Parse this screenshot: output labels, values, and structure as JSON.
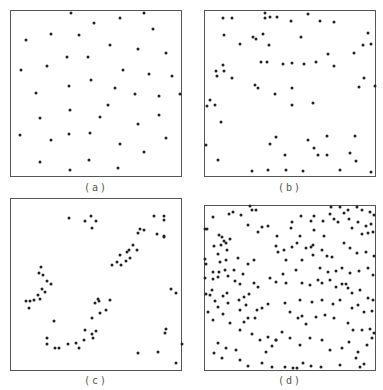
{
  "chart_data": [
    {
      "type": "scatter",
      "label": "(a)",
      "frame": {
        "x": 10,
        "y": 10,
        "w": 172,
        "h": 167
      },
      "label_pos": {
        "x": 96,
        "y": 183
      },
      "points": [
        [
          71,
          13
        ],
        [
          120,
          18
        ],
        [
          144,
          13
        ],
        [
          94,
          23
        ],
        [
          153,
          29
        ],
        [
          26,
          40
        ],
        [
          51,
          34
        ],
        [
          79,
          35
        ],
        [
          110,
          45
        ],
        [
          138,
          49
        ],
        [
          166,
          53
        ],
        [
          67,
          57
        ],
        [
          88,
          57
        ],
        [
          21,
          70
        ],
        [
          47,
          66
        ],
        [
          123,
          70
        ],
        [
          149,
          74
        ],
        [
          172,
          76
        ],
        [
          91,
          80
        ],
        [
          69,
          86
        ],
        [
          115,
          88
        ],
        [
          36,
          93
        ],
        [
          135,
          94
        ],
        [
          159,
          96
        ],
        [
          180,
          94
        ],
        [
          70,
          110
        ],
        [
          108,
          105
        ],
        [
          40,
          118
        ],
        [
          100,
          117
        ],
        [
          159,
          115
        ],
        [
          138,
          124
        ],
        [
          20,
          135
        ],
        [
          51,
          140
        ],
        [
          69,
          134
        ],
        [
          90,
          133
        ],
        [
          166,
          138
        ],
        [
          120,
          144
        ],
        [
          144,
          152
        ],
        [
          40,
          162
        ],
        [
          89,
          160
        ],
        [
          70,
          170
        ],
        [
          118,
          168
        ]
      ]
    },
    {
      "type": "scatter",
      "label": "(b)",
      "frame": {
        "x": 204,
        "y": 10,
        "w": 172,
        "h": 167
      },
      "label_pos": {
        "x": 290,
        "y": 183
      },
      "points": [
        [
          223,
          18
        ],
        [
          232,
          18
        ],
        [
          265,
          13
        ],
        [
          265,
          18
        ],
        [
          270,
          17
        ],
        [
          277,
          17
        ],
        [
          291,
          21
        ],
        [
          308,
          14
        ],
        [
          320,
          21
        ],
        [
          334,
          22
        ],
        [
          368,
          33
        ],
        [
          363,
          45
        ],
        [
          371,
          44
        ],
        [
          224,
          35
        ],
        [
          253,
          37
        ],
        [
          256,
          39
        ],
        [
          263,
          34
        ],
        [
          240,
          44
        ],
        [
          269,
          45
        ],
        [
          301,
          37
        ],
        [
          328,
          54
        ],
        [
          354,
          53
        ],
        [
          261,
          62
        ],
        [
          267,
          62
        ],
        [
          283,
          64
        ],
        [
          292,
          63
        ],
        [
          304,
          64
        ],
        [
          316,
          62
        ],
        [
          334,
          66
        ],
        [
          223,
          65
        ],
        [
          216,
          71
        ],
        [
          224,
          71
        ],
        [
          217,
          76
        ],
        [
          232,
          78
        ],
        [
          364,
          78
        ],
        [
          359,
          87
        ],
        [
          255,
          85
        ],
        [
          258,
          88
        ],
        [
          292,
          88
        ],
        [
          275,
          94
        ],
        [
          292,
          105
        ],
        [
          313,
          103
        ],
        [
          210,
          100
        ],
        [
          207,
          106
        ],
        [
          215,
          105
        ],
        [
          221,
          122
        ],
        [
          375,
          86
        ],
        [
          355,
          136
        ],
        [
          276,
          137
        ],
        [
          308,
          140
        ],
        [
          327,
          136
        ],
        [
          270,
          144
        ],
        [
          314,
          148
        ],
        [
          318,
          155
        ],
        [
          327,
          155
        ],
        [
          285,
          155
        ],
        [
          350,
          153
        ],
        [
          356,
          161
        ],
        [
          206,
          145
        ],
        [
          218,
          160
        ],
        [
          252,
          171
        ],
        [
          268,
          170
        ],
        [
          286,
          170
        ],
        [
          303,
          171
        ],
        [
          340,
          170
        ],
        [
          371,
          172
        ]
      ]
    },
    {
      "type": "scatter",
      "label": "(c)",
      "frame": {
        "x": 10,
        "y": 198,
        "w": 172,
        "h": 173
      },
      "label_pos": {
        "x": 96,
        "y": 376
      },
      "points": [
        [
          69,
          218
        ],
        [
          91,
          216
        ],
        [
          85,
          221
        ],
        [
          96,
          221
        ],
        [
          92,
          228
        ],
        [
          154,
          216
        ],
        [
          164,
          216
        ],
        [
          164,
          220
        ],
        [
          140,
          229
        ],
        [
          144,
          230
        ],
        [
          138,
          233
        ],
        [
          157,
          234
        ],
        [
          164,
          236
        ],
        [
          164,
          237
        ],
        [
          133,
          245
        ],
        [
          129,
          250
        ],
        [
          137,
          250
        ],
        [
          127,
          252
        ],
        [
          120,
          255
        ],
        [
          130,
          258
        ],
        [
          126,
          261
        ],
        [
          117,
          262
        ],
        [
          121,
          265
        ],
        [
          112,
          265
        ],
        [
          41,
          267
        ],
        [
          39,
          273
        ],
        [
          43,
          275
        ],
        [
          47,
          281
        ],
        [
          51,
          284
        ],
        [
          42,
          289
        ],
        [
          45,
          292
        ],
        [
          38,
          295
        ],
        [
          40,
          299
        ],
        [
          26,
          301
        ],
        [
          30,
          301
        ],
        [
          34,
          300
        ],
        [
          29,
          308
        ],
        [
          98,
          299
        ],
        [
          95,
          303
        ],
        [
          99,
          301
        ],
        [
          110,
          300
        ],
        [
          100,
          313
        ],
        [
          106,
          310
        ],
        [
          92,
          318
        ],
        [
          171,
          289
        ],
        [
          176,
          293
        ],
        [
          54,
          321
        ],
        [
          47,
          338
        ],
        [
          47,
          344
        ],
        [
          55,
          348
        ],
        [
          59,
          348
        ],
        [
          68,
          344
        ],
        [
          76,
          343
        ],
        [
          79,
          348
        ],
        [
          84,
          340
        ],
        [
          93,
          338
        ],
        [
          92,
          334
        ],
        [
          96,
          331
        ],
        [
          85,
          330
        ],
        [
          166,
          329
        ],
        [
          165,
          333
        ],
        [
          182,
          344
        ],
        [
          138,
          353
        ],
        [
          158,
          352
        ],
        [
          176,
          363
        ]
      ]
    },
    {
      "type": "scatter",
      "label": "(d)",
      "frame": {
        "x": 204,
        "y": 205,
        "w": 172,
        "h": 166
      },
      "label_pos": {
        "x": 290,
        "y": 376
      },
      "points": [
        [
          250,
          206
        ],
        [
          252,
          210
        ],
        [
          256,
          210
        ],
        [
          213,
          217
        ],
        [
          229,
          214
        ],
        [
          233,
          212
        ],
        [
          241,
          215
        ],
        [
          248,
          225
        ],
        [
          205,
          229
        ],
        [
          207,
          229
        ],
        [
          219,
          235
        ],
        [
          222,
          237
        ],
        [
          224,
          241
        ],
        [
          230,
          239
        ],
        [
          221,
          245
        ],
        [
          226,
          243
        ],
        [
          214,
          246
        ],
        [
          227,
          250
        ],
        [
          218,
          254
        ],
        [
          226,
          260
        ],
        [
          205,
          259
        ],
        [
          206,
          264
        ],
        [
          220,
          262
        ],
        [
          238,
          258
        ],
        [
          248,
          264
        ],
        [
          254,
          260
        ],
        [
          213,
          272
        ],
        [
          219,
          272
        ],
        [
          225,
          270
        ],
        [
          234,
          270
        ],
        [
          243,
          274
        ],
        [
          205,
          278
        ],
        [
          213,
          279
        ],
        [
          218,
          277
        ],
        [
          228,
          276
        ],
        [
          235,
          281
        ],
        [
          212,
          290
        ],
        [
          240,
          284
        ],
        [
          254,
          283
        ],
        [
          258,
          287
        ],
        [
          206,
          294
        ],
        [
          210,
          295
        ],
        [
          223,
          296
        ],
        [
          227,
          293
        ],
        [
          239,
          300
        ],
        [
          244,
          297
        ],
        [
          249,
          294
        ],
        [
          215,
          301
        ],
        [
          208,
          312
        ],
        [
          218,
          307
        ],
        [
          228,
          303
        ],
        [
          240,
          310
        ],
        [
          246,
          305
        ],
        [
          223,
          314
        ],
        [
          213,
          320
        ],
        [
          230,
          323
        ],
        [
          240,
          330
        ],
        [
          218,
          343
        ],
        [
          226,
          348
        ],
        [
          252,
          334
        ],
        [
          260,
          340
        ],
        [
          268,
          337
        ],
        [
          272,
          346
        ],
        [
          276,
          340
        ],
        [
          282,
          332
        ],
        [
          214,
          353
        ],
        [
          222,
          358
        ],
        [
          240,
          360
        ],
        [
          248,
          366
        ],
        [
          262,
          363
        ],
        [
          272,
          367
        ],
        [
          285,
          367
        ],
        [
          293,
          368
        ],
        [
          297,
          368
        ],
        [
          303,
          363
        ],
        [
          311,
          366
        ],
        [
          321,
          367
        ],
        [
          340,
          365
        ],
        [
          356,
          358
        ],
        [
          364,
          364
        ],
        [
          360,
          367
        ],
        [
          277,
          236
        ],
        [
          291,
          228
        ],
        [
          292,
          222
        ],
        [
          301,
          216
        ],
        [
          311,
          221
        ],
        [
          314,
          216
        ],
        [
          323,
          221
        ],
        [
          330,
          214
        ],
        [
          334,
          219
        ],
        [
          338,
          222
        ],
        [
          344,
          213
        ],
        [
          349,
          219
        ],
        [
          352,
          228
        ],
        [
          358,
          222
        ],
        [
          366,
          226
        ],
        [
          371,
          224
        ],
        [
          373,
          232
        ],
        [
          368,
          233
        ],
        [
          362,
          234
        ],
        [
          344,
          243
        ],
        [
          350,
          248
        ],
        [
          357,
          253
        ],
        [
          366,
          252
        ],
        [
          374,
          256
        ],
        [
          302,
          260
        ],
        [
          313,
          255
        ],
        [
          322,
          250
        ],
        [
          327,
          256
        ],
        [
          332,
          257
        ],
        [
          320,
          268
        ],
        [
          328,
          272
        ],
        [
          336,
          271
        ],
        [
          342,
          268
        ],
        [
          350,
          273
        ],
        [
          359,
          271
        ],
        [
          368,
          268
        ],
        [
          373,
          275
        ],
        [
          342,
          284
        ],
        [
          348,
          288
        ],
        [
          352,
          293
        ],
        [
          360,
          290
        ],
        [
          368,
          298
        ],
        [
          373,
          300
        ],
        [
          302,
          283
        ],
        [
          310,
          285
        ],
        [
          318,
          280
        ],
        [
          322,
          283
        ],
        [
          330,
          280
        ],
        [
          336,
          287
        ],
        [
          346,
          284
        ],
        [
          300,
          300
        ],
        [
          312,
          302
        ],
        [
          322,
          300
        ],
        [
          333,
          304
        ],
        [
          340,
          300
        ],
        [
          352,
          308
        ],
        [
          358,
          305
        ],
        [
          364,
          312
        ],
        [
          372,
          311
        ],
        [
          302,
          316
        ],
        [
          316,
          317
        ],
        [
          325,
          315
        ],
        [
          334,
          318
        ],
        [
          348,
          323
        ],
        [
          353,
          330
        ],
        [
          362,
          330
        ],
        [
          370,
          329
        ],
        [
          374,
          333
        ],
        [
          290,
          312
        ],
        [
          298,
          318
        ],
        [
          306,
          324
        ],
        [
          285,
          303
        ],
        [
          268,
          304
        ],
        [
          262,
          308
        ],
        [
          257,
          310
        ],
        [
          255,
          318
        ],
        [
          248,
          318
        ],
        [
          244,
          322
        ],
        [
          266,
          352
        ],
        [
          276,
          340
        ],
        [
          290,
          338
        ],
        [
          300,
          345
        ],
        [
          310,
          338
        ],
        [
          322,
          340
        ],
        [
          330,
          350
        ],
        [
          342,
          348
        ],
        [
          349,
          342
        ],
        [
          358,
          352
        ],
        [
          367,
          345
        ],
        [
          372,
          338
        ],
        [
          286,
          260
        ],
        [
          296,
          270
        ],
        [
          314,
          230
        ],
        [
          324,
          236
        ],
        [
          348,
          210
        ],
        [
          362,
          210
        ],
        [
          370,
          212
        ],
        [
          374,
          215
        ],
        [
          331,
          207
        ],
        [
          340,
          207
        ],
        [
          357,
          207
        ],
        [
          276,
          246
        ],
        [
          284,
          250
        ],
        [
          292,
          247
        ],
        [
          297,
          243
        ],
        [
          300,
          236
        ],
        [
          270,
          278
        ],
        [
          276,
          282
        ],
        [
          306,
          248
        ],
        [
          311,
          247
        ],
        [
          313,
          245
        ],
        [
          258,
          232
        ],
        [
          262,
          227
        ],
        [
          268,
          226
        ],
        [
          278,
          252
        ],
        [
          283,
          274
        ],
        [
          286,
          283
        ],
        [
          236,
          350
        ]
      ]
    }
  ]
}
